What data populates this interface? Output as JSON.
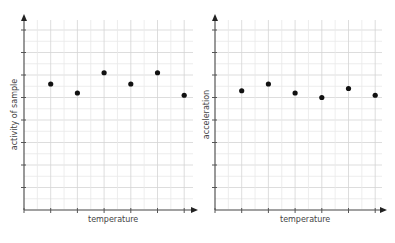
{
  "chart_data": [
    {
      "type": "scatter",
      "title": "",
      "xlabel": "temperature",
      "ylabel": "activity of sample",
      "x": [
        1,
        2,
        3,
        4,
        5,
        6
      ],
      "series": [
        {
          "name": "activity of sample",
          "values": [
            5.6,
            5.2,
            6.1,
            5.6,
            6.1,
            5.1
          ]
        }
      ],
      "xlim": [
        0,
        6.5
      ],
      "ylim": [
        0,
        8.5
      ],
      "grid": true,
      "tick_labels": false,
      "legend": "none"
    },
    {
      "type": "scatter",
      "title": "",
      "xlabel": "temperature",
      "ylabel": "acceleration",
      "x": [
        1,
        2,
        3,
        4,
        5,
        6
      ],
      "series": [
        {
          "name": "acceleration",
          "values": [
            5.3,
            5.6,
            5.2,
            5.0,
            5.4,
            5.1
          ]
        }
      ],
      "xlim": [
        0,
        6.5
      ],
      "ylim": [
        0,
        8.5
      ],
      "grid": true,
      "tick_labels": false,
      "legend": "none"
    }
  ],
  "charts": {
    "left": {
      "xlabel": "temperature",
      "ylabel": "activity of sample"
    },
    "right": {
      "xlabel": "temperature",
      "ylabel": "acceleration"
    }
  },
  "colors": {
    "axis": "#555555",
    "grid_major": "#d4d4d4",
    "grid_minor": "#e8e8e8",
    "point": "#111111"
  }
}
